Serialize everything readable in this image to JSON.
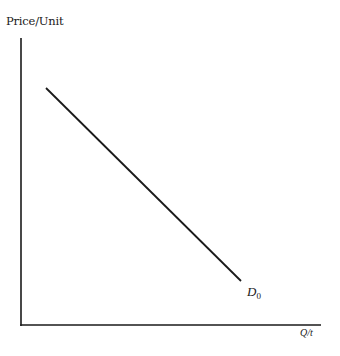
{
  "diagram": {
    "type": "demand-curve",
    "y_axis_label": "Price/Unit",
    "x_axis_label": "Q/t",
    "curve": {
      "label": "D",
      "subscript": "0",
      "description": "Downward-sloping linear demand curve"
    },
    "colors": {
      "line": "#1a1a1a",
      "background": "#ffffff"
    }
  }
}
